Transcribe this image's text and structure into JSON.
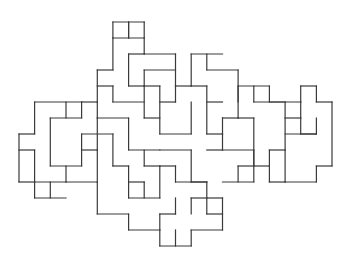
{
  "figure": {
    "type": "polyomino-tiling-outline",
    "background": "#ffffff",
    "stroke": "#3a3a3a",
    "grid": {
      "x0": 19,
      "y0": 22,
      "cell_w": 15.65,
      "cell_h": 16.0
    },
    "segments": [
      [
        6,
        1,
        8,
        1
      ],
      [
        8,
        1,
        8,
        2
      ],
      [
        8,
        2,
        10,
        2
      ],
      [
        6,
        1,
        6,
        3
      ],
      [
        5,
        3,
        6,
        3
      ],
      [
        5,
        3,
        5,
        5
      ],
      [
        7,
        2,
        8,
        2
      ],
      [
        7,
        2,
        7,
        4
      ],
      [
        7,
        4,
        8,
        4
      ],
      [
        7,
        0,
        7,
        1
      ],
      [
        6,
        0,
        8,
        0
      ],
      [
        6,
        0,
        6,
        1
      ],
      [
        7,
        0,
        7,
        1
      ],
      [
        8,
        0,
        8,
        1
      ],
      [
        6,
        4,
        6,
        5
      ],
      [
        6,
        5,
        8,
        5
      ],
      [
        8,
        4,
        8,
        6
      ],
      [
        8,
        4,
        9,
        4
      ],
      [
        8,
        3,
        10,
        3
      ],
      [
        8,
        3,
        8,
        4
      ],
      [
        10,
        2,
        10,
        4
      ],
      [
        10,
        4,
        11,
        4
      ],
      [
        9,
        4,
        9,
        7
      ],
      [
        8,
        6,
        9,
        6
      ],
      [
        10,
        4,
        10,
        5
      ],
      [
        9,
        5,
        10,
        5
      ],
      [
        5,
        4,
        6,
        4
      ],
      [
        5,
        5,
        5,
        6
      ],
      [
        4,
        5,
        5,
        5
      ],
      [
        4,
        5,
        4,
        6
      ],
      [
        1,
        5,
        4,
        5
      ],
      [
        1,
        5,
        1,
        7
      ],
      [
        0,
        7,
        1,
        7
      ],
      [
        0,
        7,
        0,
        10
      ],
      [
        0,
        10,
        1,
        10
      ],
      [
        1,
        10,
        1,
        11
      ],
      [
        1,
        11,
        3,
        11
      ],
      [
        5,
        6,
        7,
        6
      ],
      [
        7,
        6,
        7,
        8
      ],
      [
        7,
        8,
        9,
        8
      ],
      [
        9,
        7,
        11,
        7
      ],
      [
        11,
        5,
        11,
        7
      ],
      [
        2,
        6,
        4,
        6
      ],
      [
        2,
        6,
        2,
        9
      ],
      [
        2,
        9,
        4,
        9
      ],
      [
        4,
        7,
        6,
        7
      ],
      [
        4,
        7,
        4,
        9
      ],
      [
        3,
        5,
        3,
        6
      ],
      [
        1,
        8,
        1,
        10
      ],
      [
        0,
        8,
        1,
        8
      ],
      [
        1,
        10,
        3,
        10
      ],
      [
        3,
        9,
        3,
        10
      ],
      [
        3,
        10,
        5,
        10
      ],
      [
        5,
        8,
        5,
        10
      ],
      [
        4,
        8,
        5,
        8
      ],
      [
        2,
        10,
        2,
        11
      ],
      [
        5,
        6,
        5,
        8
      ],
      [
        6,
        7,
        6,
        9
      ],
      [
        6,
        9,
        7,
        9
      ],
      [
        7,
        9,
        7,
        11
      ],
      [
        5,
        10,
        5,
        12
      ],
      [
        5,
        12,
        7,
        12
      ],
      [
        7,
        11,
        9,
        11
      ],
      [
        9,
        9,
        9,
        11
      ],
      [
        8,
        9,
        9,
        9
      ],
      [
        8,
        8,
        8,
        9
      ],
      [
        9,
        8,
        11,
        8
      ],
      [
        11,
        8,
        11,
        10
      ],
      [
        11,
        10,
        12,
        10
      ],
      [
        12,
        10,
        12,
        12
      ],
      [
        10,
        10,
        12,
        10
      ],
      [
        10,
        9,
        10,
        10
      ],
      [
        9,
        9,
        10,
        9
      ],
      [
        7,
        10,
        8,
        10
      ],
      [
        8,
        10,
        8,
        11
      ],
      [
        7,
        12,
        7,
        13
      ],
      [
        7,
        13,
        9,
        13
      ],
      [
        9,
        12,
        9,
        13
      ],
      [
        9,
        12,
        10,
        12
      ],
      [
        10,
        11,
        10,
        12
      ],
      [
        11,
        11,
        12,
        11
      ],
      [
        11,
        11,
        11,
        12
      ],
      [
        9,
        13,
        9,
        14
      ],
      [
        9,
        14,
        11,
        14
      ],
      [
        11,
        13,
        11,
        14
      ],
      [
        10,
        13,
        10,
        14
      ],
      [
        11,
        13,
        13,
        13
      ],
      [
        13,
        11,
        13,
        13
      ],
      [
        12,
        11,
        13,
        11
      ],
      [
        12,
        12,
        13,
        12
      ],
      [
        11,
        2,
        13,
        2
      ],
      [
        11,
        2,
        11,
        4
      ],
      [
        12,
        2,
        12,
        3
      ],
      [
        12,
        3,
        14,
        3
      ],
      [
        14,
        3,
        14,
        6
      ],
      [
        13,
        6,
        14,
        6
      ],
      [
        13,
        6,
        13,
        7
      ],
      [
        12,
        7,
        13,
        7
      ],
      [
        12,
        4,
        12,
        7
      ],
      [
        11,
        4,
        12,
        4
      ],
      [
        12,
        5,
        13,
        5
      ],
      [
        14,
        4,
        16,
        4
      ],
      [
        14,
        4,
        14,
        5
      ],
      [
        15,
        4,
        15,
        5
      ],
      [
        15,
        5,
        17,
        5
      ],
      [
        17,
        5,
        17,
        8
      ],
      [
        16,
        8,
        17,
        8
      ],
      [
        16,
        8,
        16,
        9
      ],
      [
        15,
        9,
        16,
        9
      ],
      [
        15,
        6,
        15,
        9
      ],
      [
        14,
        6,
        15,
        6
      ],
      [
        13,
        7,
        13,
        8
      ],
      [
        13,
        8,
        15,
        8
      ],
      [
        15,
        8,
        15,
        10
      ],
      [
        13,
        10,
        15,
        10
      ],
      [
        12,
        8,
        13,
        8
      ],
      [
        14,
        9,
        15,
        9
      ],
      [
        14,
        9,
        14,
        10
      ],
      [
        16,
        5,
        18,
        5
      ],
      [
        16,
        4,
        16,
        5
      ],
      [
        18,
        5,
        18,
        6
      ],
      [
        17,
        6,
        18,
        6
      ],
      [
        18,
        4,
        19,
        4
      ],
      [
        18,
        4,
        18,
        5
      ],
      [
        19,
        4,
        19,
        5
      ],
      [
        19,
        5,
        20,
        5
      ],
      [
        20,
        5,
        20,
        9
      ],
      [
        19,
        9,
        20,
        9
      ],
      [
        19,
        9,
        19,
        10
      ],
      [
        17,
        10,
        19,
        10
      ],
      [
        17,
        8,
        17,
        10
      ],
      [
        18,
        6,
        18,
        7
      ],
      [
        18,
        7,
        19,
        7
      ],
      [
        19,
        6,
        19,
        7
      ],
      [
        17,
        7,
        19,
        7
      ],
      [
        16,
        9,
        16,
        10
      ],
      [
        16,
        10,
        17,
        10
      ]
    ]
  }
}
